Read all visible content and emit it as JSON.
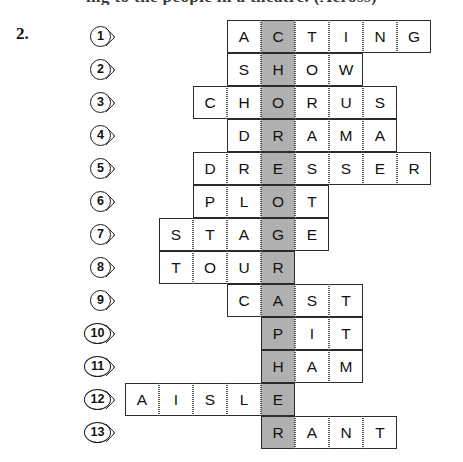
{
  "page": {
    "top_cut_line": "ing to the people in a theatre. (Across)",
    "exercise_number": "2."
  },
  "puzzle": {
    "type": "crossword-acrostic",
    "cell_width": 34,
    "cell_height": 33,
    "grid_origin_x": 125,
    "grid_origin_y": 20,
    "shaded_column_index": 4,
    "shaded_color": "#b0b0b0",
    "cell_color": "#ffffff",
    "border_color": "#2b2b2b",
    "hidden_word": "CHOREOGRAPHER",
    "rows": [
      {
        "number": "1",
        "answer": "ACTING",
        "letters": [
          "A",
          "C",
          "T",
          "I",
          "N",
          "G"
        ],
        "start_col": 3,
        "shaded_index": 1
      },
      {
        "number": "2",
        "answer": "SHOW",
        "letters": [
          "S",
          "H",
          "O",
          "W"
        ],
        "start_col": 3,
        "shaded_index": 1
      },
      {
        "number": "3",
        "answer": "CHORUS",
        "letters": [
          "C",
          "H",
          "O",
          "R",
          "U",
          "S"
        ],
        "start_col": 2,
        "shaded_index": 2
      },
      {
        "number": "4",
        "answer": "DRAMA",
        "letters": [
          "D",
          "R",
          "A",
          "M",
          "A"
        ],
        "start_col": 3,
        "shaded_index": 1
      },
      {
        "number": "5",
        "answer": "DRESSER",
        "letters": [
          "D",
          "R",
          "E",
          "S",
          "S",
          "E",
          "R"
        ],
        "start_col": 2,
        "shaded_index": 2
      },
      {
        "number": "6",
        "answer": "PLOT",
        "letters": [
          "P",
          "L",
          "O",
          "T"
        ],
        "start_col": 2,
        "shaded_index": 2
      },
      {
        "number": "7",
        "answer": "STAGE",
        "letters": [
          "S",
          "T",
          "A",
          "G",
          "E"
        ],
        "start_col": 1,
        "shaded_index": 3
      },
      {
        "number": "8",
        "answer": "TOUR",
        "letters": [
          "T",
          "O",
          "U",
          "R"
        ],
        "start_col": 1,
        "shaded_index": 3
      },
      {
        "number": "9",
        "answer": "CAST",
        "letters": [
          "C",
          "A",
          "S",
          "T"
        ],
        "start_col": 3,
        "shaded_index": 1
      },
      {
        "number": "10",
        "answer": "PIT",
        "letters": [
          "P",
          "I",
          "T"
        ],
        "start_col": 4,
        "shaded_index": 0
      },
      {
        "number": "11",
        "answer": "HAM",
        "letters": [
          "H",
          "A",
          "M"
        ],
        "start_col": 4,
        "shaded_index": 0
      },
      {
        "number": "12",
        "answer": "AISLE",
        "letters": [
          "A",
          "I",
          "S",
          "L",
          "E"
        ],
        "start_col": 0,
        "shaded_index": 4
      },
      {
        "number": "13",
        "answer": "RANT",
        "letters": [
          "R",
          "A",
          "N",
          "T"
        ],
        "start_col": 4,
        "shaded_index": 0
      }
    ],
    "bubble_x_one_digit": 90,
    "bubble_x_two_digit": 84
  }
}
